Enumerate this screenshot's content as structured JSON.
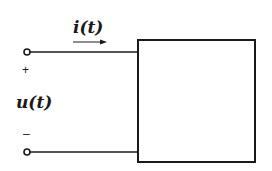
{
  "diagram": {
    "type": "circuit",
    "title": "",
    "labels": {
      "current": "i(t)",
      "voltage": "u(t)",
      "plus": "+",
      "minus": "–"
    },
    "elements": [
      {
        "id": "terminal-top",
        "kind": "open-terminal"
      },
      {
        "id": "terminal-bottom",
        "kind": "open-terminal"
      },
      {
        "id": "wire-top",
        "kind": "wire"
      },
      {
        "id": "wire-bottom",
        "kind": "wire"
      },
      {
        "id": "network-box",
        "kind": "one-port-network"
      },
      {
        "id": "current-arrow",
        "kind": "reference-direction-arrow"
      }
    ],
    "colors": {
      "stroke": "#1a1a1a",
      "background": "#ffffff"
    }
  }
}
